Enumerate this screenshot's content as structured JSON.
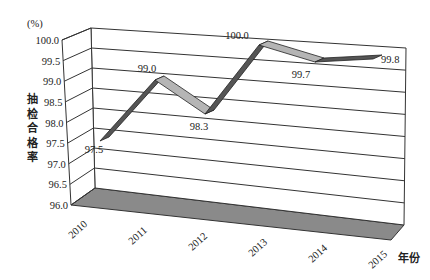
{
  "chart_data": {
    "type": "line",
    "style": "3d-ribbon",
    "title": "",
    "ylabel": "抽检合格率",
    "yunit": "(%)",
    "xlabel": "年份",
    "categories": [
      "2010",
      "2011",
      "2012",
      "2013",
      "2014",
      "2015"
    ],
    "series": [
      {
        "name": "抽检合格率",
        "values": [
          97.5,
          99.0,
          98.3,
          100.0,
          99.7,
          99.8
        ]
      }
    ],
    "data_labels": [
      "97.5",
      "99.0",
      "98.3",
      "100.0",
      "99.7",
      "99.8"
    ],
    "yticks": [
      "96.0",
      "96.5",
      "97.0",
      "97.5",
      "98.0",
      "98.5",
      "99.0",
      "99.5",
      "100.0"
    ],
    "ylim": [
      96.0,
      100.0
    ],
    "grid": true,
    "legend": null
  },
  "colors": {
    "ribbon_top": "#b5b5b5",
    "ribbon_side": "#444444",
    "floor": "#8a8a8a",
    "grid": "#333333"
  }
}
